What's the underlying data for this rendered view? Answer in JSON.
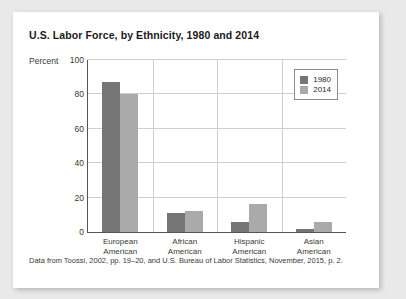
{
  "figure": {
    "title": "U.S. Labor Force, by Ethnicity, 1980 and 2014",
    "source_note": "Data from Toossi, 2002, pp. 19–20, and U.S. Bureau of Labor Statistics, November, 2015, p. 2."
  },
  "legend": {
    "position": "top-right",
    "entries": [
      {
        "label": "1980",
        "color": "#757575"
      },
      {
        "label": "2014",
        "color": "#aaaaaa"
      }
    ]
  },
  "chart_data": {
    "type": "bar",
    "title": "U.S. Labor Force, by Ethnicity, 1980 and 2014",
    "xlabel": "",
    "ylabel": "Percent",
    "ylim": [
      0,
      100
    ],
    "yticks": [
      0,
      20,
      40,
      60,
      80,
      100
    ],
    "grid": true,
    "categories": [
      "European American",
      "African American",
      "Hispanic American",
      "Asian American"
    ],
    "category_lines": [
      [
        "European",
        "American"
      ],
      [
        "African",
        "American"
      ],
      [
        "Hispanic",
        "American"
      ],
      [
        "Asian",
        "American"
      ]
    ],
    "series": [
      {
        "name": "1980",
        "color": "#757575",
        "values": [
          87,
          11,
          6,
          2
        ]
      },
      {
        "name": "2014",
        "color": "#aaaaaa",
        "values": [
          80,
          12,
          16,
          6
        ]
      }
    ]
  }
}
